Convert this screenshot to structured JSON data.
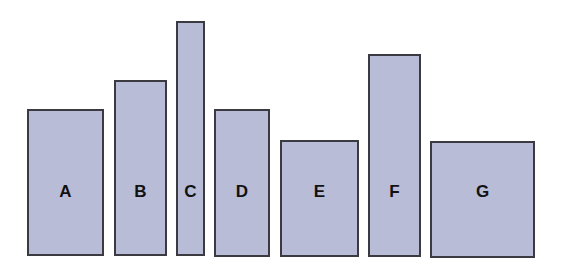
{
  "colors": {
    "bar_fill": "#b8bcd6",
    "bar_border": "#3a3a40",
    "label": "#111111",
    "background": "#ffffff"
  },
  "label_y": 181,
  "chart_data": {
    "type": "bar",
    "title": "",
    "xlabel": "",
    "ylabel": "",
    "categories": [
      "A",
      "B",
      "C",
      "D",
      "E",
      "F",
      "G"
    ],
    "values_px_height": [
      147,
      176,
      235,
      148,
      117,
      203,
      117
    ],
    "widths_px": [
      77,
      53,
      29,
      56,
      79,
      53,
      105
    ],
    "grid": false,
    "legend": null
  },
  "bars": [
    {
      "label": "A",
      "left": 27,
      "top": 109,
      "width": 77,
      "height": 147
    },
    {
      "label": "B",
      "left": 114,
      "top": 80,
      "width": 53,
      "height": 176
    },
    {
      "label": "C",
      "left": 176,
      "top": 21,
      "width": 29,
      "height": 235
    },
    {
      "label": "D",
      "left": 214,
      "top": 109,
      "width": 56,
      "height": 148
    },
    {
      "label": "E",
      "left": 280,
      "top": 140,
      "width": 79,
      "height": 117
    },
    {
      "label": "F",
      "left": 368,
      "top": 54,
      "width": 53,
      "height": 203
    },
    {
      "label": "G",
      "left": 430,
      "top": 141,
      "width": 105,
      "height": 117
    }
  ]
}
